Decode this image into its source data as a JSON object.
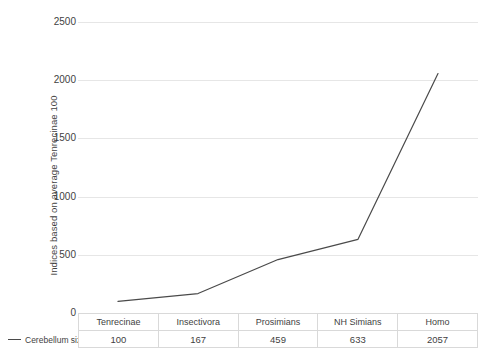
{
  "chart_data": {
    "type": "line",
    "title": "",
    "xlabel": "",
    "ylabel": "Indices based on average Tenrecinae 100",
    "categories": [
      "Tenrecinae",
      "Insectivora",
      "Prosimians",
      "NH Simians",
      "Homo"
    ],
    "series": [
      {
        "name": "Cerebellum size",
        "values": [
          100,
          167,
          459,
          633,
          2057
        ],
        "color": "#4a4a4a"
      }
    ],
    "ylim": [
      0,
      2500
    ],
    "yticks": [
      0,
      500,
      1000,
      1500,
      2000,
      2500
    ],
    "ytick_labels": [
      "0",
      "500",
      "1000",
      "1500",
      "2000",
      "2500"
    ],
    "grid": true,
    "legend_position": "bottom-left",
    "has_data_table": true
  },
  "legend": {
    "entries": [
      {
        "label": "Cerebellum size",
        "marker": "line-dash"
      }
    ]
  },
  "table": {
    "row_label": "Cerebellum size",
    "headers": [
      "Tenrecinae",
      "Insectivora",
      "Prosimians",
      "NH Simians",
      "Homo"
    ],
    "values": [
      "100",
      "167",
      "459",
      "633",
      "2057"
    ]
  },
  "axis": {
    "y_title": "Indices based on average Tenrecinae 100",
    "y_ticks": [
      "2500",
      "2000",
      "1500",
      "1000",
      "500",
      "0"
    ]
  },
  "colors": {
    "series_line": "#4a4a4a",
    "gridline": "#e6e6e6",
    "table_border": "#d9d9d9",
    "text": "#3f3f3f",
    "background": "#ffffff"
  }
}
